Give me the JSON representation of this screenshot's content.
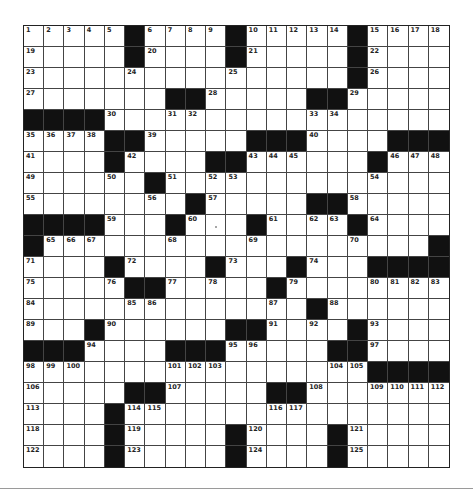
{
  "puzzle": {
    "rows": 21,
    "cols": 21,
    "colors": {
      "block": "#111111",
      "cell": "#ffffff",
      "line": "#444444",
      "number": "#222222"
    },
    "grid": [
      ".....#....#.....#....",
      ".....#....#.....#....",
      "................#....",
      ".......##.....##.....",
      "####.................",
      "....##.....###....###",
      "....#....##......#...",
      "......#..............",
      "........#.....##.....",
      "####...#...#....#....",
      "#...................#",
      "....#....#...#...####",
      ".....##.....#........",
      "..............#......",
      "...#......##....#....",
      "###....###.....##....",
      ".................####",
      ".....##.....##.......",
      "....#................",
      "....#.....#....#.....",
      "....#.....#....#....."
    ],
    "numbers": [
      [
        1,
        2,
        3,
        4,
        5,
        null,
        6,
        7,
        8,
        9,
        null,
        10,
        11,
        12,
        13,
        14,
        null,
        15,
        16,
        17,
        18
      ],
      [
        19,
        null,
        null,
        null,
        null,
        null,
        20,
        null,
        null,
        null,
        null,
        21,
        null,
        null,
        null,
        null,
        null,
        22,
        null,
        null,
        null
      ],
      [
        23,
        null,
        null,
        null,
        null,
        24,
        null,
        null,
        null,
        null,
        25,
        null,
        null,
        null,
        null,
        null,
        null,
        26,
        null,
        null,
        null
      ],
      [
        27,
        null,
        null,
        null,
        null,
        null,
        null,
        null,
        null,
        28,
        null,
        null,
        null,
        null,
        null,
        null,
        29,
        null,
        null,
        null,
        null
      ],
      [
        null,
        null,
        null,
        null,
        30,
        null,
        null,
        31,
        32,
        null,
        null,
        null,
        null,
        null,
        33,
        34,
        null,
        null,
        null,
        null,
        null
      ],
      [
        35,
        36,
        37,
        38,
        null,
        null,
        39,
        null,
        null,
        null,
        null,
        null,
        null,
        null,
        40,
        null,
        null,
        null,
        null,
        null,
        null
      ],
      [
        41,
        null,
        null,
        null,
        null,
        42,
        null,
        null,
        null,
        null,
        null,
        43,
        44,
        45,
        null,
        null,
        null,
        null,
        46,
        47,
        48
      ],
      [
        49,
        null,
        null,
        null,
        50,
        null,
        null,
        51,
        null,
        52,
        53,
        null,
        null,
        null,
        null,
        null,
        null,
        54,
        null,
        null,
        null
      ],
      [
        55,
        null,
        null,
        null,
        null,
        null,
        56,
        null,
        null,
        57,
        null,
        null,
        null,
        null,
        null,
        null,
        58,
        null,
        null,
        null,
        null
      ],
      [
        null,
        null,
        null,
        null,
        59,
        null,
        null,
        null,
        60,
        null,
        null,
        null,
        61,
        null,
        62,
        63,
        null,
        64,
        null,
        null,
        null
      ],
      [
        null,
        65,
        66,
        67,
        null,
        null,
        null,
        68,
        null,
        null,
        null,
        69,
        null,
        null,
        null,
        null,
        70,
        null,
        null,
        null,
        null
      ],
      [
        71,
        null,
        null,
        null,
        null,
        72,
        null,
        null,
        null,
        null,
        73,
        null,
        null,
        null,
        74,
        null,
        null,
        null,
        null,
        null,
        null
      ],
      [
        75,
        null,
        null,
        null,
        76,
        null,
        null,
        77,
        null,
        78,
        null,
        null,
        null,
        79,
        null,
        null,
        null,
        80,
        81,
        82,
        83
      ],
      [
        84,
        null,
        null,
        null,
        null,
        85,
        86,
        null,
        null,
        null,
        null,
        null,
        87,
        null,
        null,
        88,
        null,
        null,
        null,
        null,
        null
      ],
      [
        89,
        null,
        null,
        null,
        90,
        null,
        null,
        null,
        null,
        null,
        null,
        null,
        91,
        null,
        92,
        null,
        null,
        93,
        null,
        null,
        null
      ],
      [
        null,
        null,
        null,
        94,
        null,
        null,
        null,
        null,
        null,
        null,
        95,
        96,
        null,
        null,
        null,
        null,
        null,
        97,
        null,
        null,
        null
      ],
      [
        98,
        99,
        100,
        null,
        null,
        null,
        null,
        101,
        102,
        103,
        null,
        null,
        null,
        null,
        null,
        104,
        105,
        null,
        null,
        null,
        null
      ],
      [
        106,
        null,
        null,
        null,
        null,
        null,
        null,
        107,
        null,
        null,
        null,
        null,
        null,
        null,
        108,
        null,
        null,
        109,
        110,
        111,
        112
      ],
      [
        113,
        null,
        null,
        null,
        null,
        114,
        115,
        null,
        null,
        null,
        null,
        null,
        116,
        117,
        null,
        null,
        null,
        null,
        null,
        null,
        null
      ],
      [
        118,
        null,
        null,
        null,
        null,
        119,
        null,
        null,
        null,
        null,
        null,
        120,
        null,
        null,
        null,
        null,
        121,
        null,
        null,
        null,
        null
      ],
      [
        122,
        null,
        null,
        null,
        null,
        123,
        null,
        null,
        null,
        null,
        null,
        124,
        null,
        null,
        null,
        null,
        125,
        null,
        null,
        null,
        null
      ]
    ],
    "letters": [],
    "cursor": {
      "row": 9,
      "col": 9
    }
  }
}
